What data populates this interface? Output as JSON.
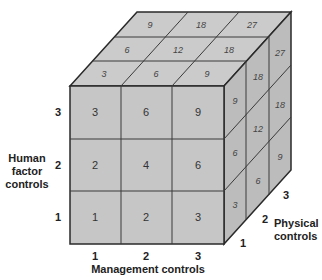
{
  "diagram": {
    "colors": {
      "front": "#c6c6c6",
      "top": "#cbcbcb",
      "right": "#bcbcbc",
      "edge": "#2a2a2a"
    },
    "axes": {
      "x": {
        "label": "Management controls",
        "ticks": [
          "1",
          "2",
          "3"
        ]
      },
      "y": {
        "label_lines": [
          "Human",
          "factor",
          "controls"
        ],
        "ticks": [
          "1",
          "2",
          "3"
        ]
      },
      "z": {
        "label_lines": [
          "Physical",
          "controls"
        ],
        "ticks": [
          "1",
          "2",
          "3"
        ]
      }
    },
    "front_face": {
      "rows_top_to_bottom": [
        [
          "3",
          "6",
          "9"
        ],
        [
          "2",
          "4",
          "6"
        ],
        [
          "1",
          "2",
          "3"
        ]
      ]
    },
    "top_face": {
      "rows_back_to_front": [
        [
          "9",
          "18",
          "27"
        ],
        [
          "6",
          "12",
          "18"
        ],
        [
          "3",
          "6",
          "9"
        ]
      ]
    },
    "right_face": {
      "rows_top_to_bottom_front_to_back": [
        [
          "9",
          "18",
          "27"
        ],
        [
          "6",
          "12",
          "18"
        ],
        [
          "3",
          "6",
          "9"
        ]
      ]
    }
  }
}
